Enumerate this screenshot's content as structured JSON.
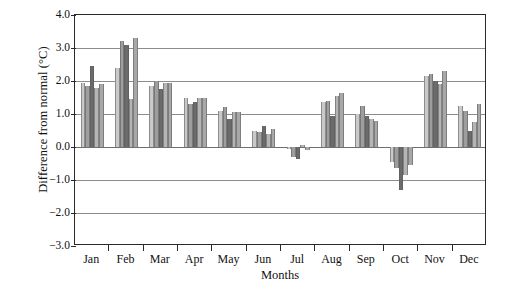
{
  "chart_data": {
    "type": "bar",
    "title": "",
    "subtitle": "",
    "xlabel": "Months",
    "ylabel": "Difference from normal (°C)",
    "ylim": [
      -3.0,
      4.0
    ],
    "ytick_labels": [
      "4.0",
      "3.0",
      "2.0",
      "1.0",
      "0.0",
      "−1.0",
      "−2.0",
      "−3.0"
    ],
    "ytick_values": [
      4.0,
      3.0,
      2.0,
      1.0,
      0.0,
      -1.0,
      -2.0,
      -3.0
    ],
    "grid": true,
    "legend": "none",
    "categories": [
      "Jan",
      "Feb",
      "Mar",
      "Apr",
      "May",
      "Jun",
      "Jul",
      "Aug",
      "Sep",
      "Oct",
      "Nov",
      "Dec"
    ],
    "series": [
      {
        "name": "series-1",
        "color": "#c9c9c9",
        "values": [
          1.95,
          2.4,
          1.85,
          1.5,
          1.1,
          0.5,
          -0.05,
          1.35,
          1.0,
          -0.45,
          2.15,
          1.25
        ]
      },
      {
        "name": "series-2",
        "color": "#9e9e9e",
        "values": [
          1.85,
          3.2,
          2.0,
          1.3,
          1.2,
          0.45,
          -0.3,
          1.4,
          1.25,
          -0.65,
          2.2,
          1.1
        ]
      },
      {
        "name": "series-3",
        "color": "#6b6b6b",
        "values": [
          2.45,
          3.1,
          1.75,
          1.35,
          0.85,
          0.65,
          -0.35,
          0.95,
          0.95,
          -1.3,
          2.0,
          0.5
        ]
      },
      {
        "name": "series-4",
        "color": "#b5b5b5",
        "values": [
          1.8,
          1.45,
          1.95,
          1.5,
          1.05,
          0.4,
          0.05,
          1.55,
          0.85,
          -0.85,
          1.9,
          0.75
        ]
      },
      {
        "name": "series-5",
        "color": "#a8a8a8",
        "values": [
          1.9,
          3.3,
          1.95,
          1.5,
          1.05,
          0.55,
          -0.1,
          1.65,
          0.8,
          -0.55,
          2.3,
          1.3
        ]
      }
    ]
  },
  "axes": {
    "frame_color": "#2a2a2a",
    "grid_color": "#8c8c8c",
    "background": "#ffffff"
  }
}
